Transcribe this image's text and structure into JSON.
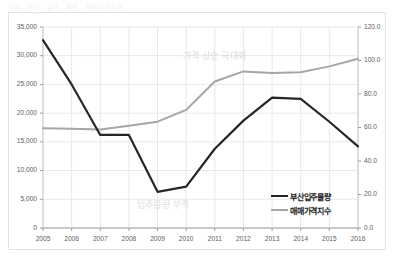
{
  "heading": {
    "fragments": [
      "자료",
      "부산",
      "입주",
      "물량",
      "매매가격지수"
    ]
  },
  "chart_data": {
    "type": "line",
    "title": "",
    "xlabel": "",
    "ylabel": "",
    "grid": true,
    "legend_position": "inside-bottom-right",
    "x": [
      2005,
      2006,
      2007,
      2008,
      2009,
      2010,
      2011,
      2012,
      2013,
      2014,
      2015,
      2016
    ],
    "categories": [
      "2005",
      "2006",
      "2007",
      "2008",
      "2009",
      "2010",
      "2011",
      "2012",
      "2013",
      "2014",
      "2015",
      "2016"
    ],
    "axes": {
      "left": {
        "label": "",
        "ylim": [
          0,
          35000
        ],
        "ticks": [
          0,
          5000,
          10000,
          15000,
          20000,
          25000,
          30000,
          35000
        ],
        "tick_labels": [
          "0",
          "5,000",
          "10,000",
          "15,000",
          "20,000",
          "25,000",
          "30,000",
          "35,000"
        ]
      },
      "right": {
        "label": "",
        "ylim": [
          0,
          120
        ],
        "ticks": [
          0,
          20,
          40,
          60,
          80,
          100,
          120
        ],
        "tick_labels": [
          "0.0",
          "20.0",
          "40.0",
          "60.0",
          "80.0",
          "100.0",
          "120.0"
        ]
      }
    },
    "series": [
      {
        "name": "부산입주물량",
        "axis": "left",
        "color": "#262626",
        "values": [
          32700,
          25000,
          16200,
          16200,
          6300,
          7200,
          13800,
          18700,
          22700,
          22500,
          18500,
          14200
        ]
      },
      {
        "name": "매매가격지수",
        "axis": "right",
        "color": "#a6a6a6",
        "values": [
          59.5,
          59.3,
          58.8,
          61.0,
          63.5,
          70.5,
          87.5,
          93.5,
          92.5,
          93.0,
          96.5,
          101.0
        ]
      }
    ],
    "annotations": [
      {
        "text": "가격 상승 극대화",
        "x": 2011.2,
        "y_right": 103.5
      },
      {
        "text": "입주물량 부족",
        "x": 2009.6,
        "y_left": 4200
      }
    ]
  },
  "colors": {
    "series_black": "#262626",
    "series_gray": "#a6a6a6",
    "grid": "#e8e8e8",
    "frame": "#e3e3e3",
    "axis_text": "#5e5e5e",
    "annotation_text": "#dcdcdc"
  }
}
